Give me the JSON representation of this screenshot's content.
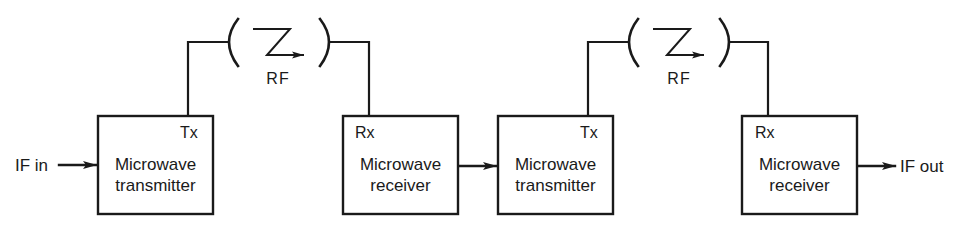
{
  "diagram": {
    "type": "block-diagram",
    "colors": {
      "line": "#1a1a1a",
      "background": "#ffffff"
    },
    "input_label": "IF in",
    "output_label": "IF out",
    "blocks": [
      {
        "id": "tx1",
        "tag": "Tx",
        "line1": "Microwave",
        "line2": "transmitter"
      },
      {
        "id": "rx1",
        "tag": "Rx",
        "line1": "Microwave",
        "line2": "receiver"
      },
      {
        "id": "tx2",
        "tag": "Tx",
        "line1": "Microwave",
        "line2": "transmitter"
      },
      {
        "id": "rx2",
        "tag": "Rx",
        "line1": "Microwave",
        "line2": "receiver"
      }
    ],
    "links": [
      {
        "id": "rf1",
        "label": "RF",
        "icon": "radio-link-zigzag-arrow"
      },
      {
        "id": "rf2",
        "label": "RF",
        "icon": "radio-link-zigzag-arrow"
      }
    ],
    "connections": [
      {
        "from": "IF in",
        "to": "tx1"
      },
      {
        "from": "tx1",
        "to": "rx1",
        "via": "rf1"
      },
      {
        "from": "rx1",
        "to": "tx2"
      },
      {
        "from": "tx2",
        "to": "rx2",
        "via": "rf2"
      },
      {
        "from": "rx2",
        "to": "IF out"
      }
    ]
  }
}
